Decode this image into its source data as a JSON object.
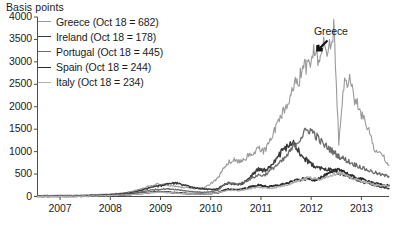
{
  "axis": {
    "ylabel": "Basis points",
    "yticks": [
      "4000",
      "3500",
      "3000",
      "2500",
      "2000",
      "1500",
      "1000",
      "500",
      "0"
    ],
    "xticks": [
      "2007",
      "2008",
      "2009",
      "2010",
      "2011",
      "2012",
      "2013"
    ]
  },
  "annotation": {
    "greece_label": "Greece"
  },
  "legend": [
    {
      "label": "Greece (Oct 18 = 682)",
      "color": "#9a9a9a",
      "width": 1.1
    },
    {
      "label": "Ireland (Oct 18 = 178)",
      "color": "#3a3a3a",
      "width": 1.5
    },
    {
      "label": "Portugal (Oct 18 = 445)",
      "color": "#6b6b6b",
      "width": 1.3
    },
    {
      "label": "Spain (Oct 18 = 244)",
      "color": "#2a2a2a",
      "width": 1.8
    },
    {
      "label": "Italy (Oct 18 = 234)",
      "color": "#b0b0b0",
      "width": 1.4
    }
  ],
  "chart_data": {
    "type": "line",
    "title": "",
    "xlabel": "",
    "ylabel": "Basis points",
    "ylim": [
      0,
      4000
    ],
    "xlim": [
      "2006-07",
      "2013-08"
    ],
    "grid": false,
    "legend_position": "top-left",
    "x_tick_values": [
      2007,
      2008,
      2009,
      2010,
      2011,
      2012,
      2013
    ],
    "x": [
      2006.55,
      2006.65,
      2006.75,
      2006.85,
      2006.95,
      2007.05,
      2007.15,
      2007.25,
      2007.35,
      2007.45,
      2007.55,
      2007.65,
      2007.75,
      2007.85,
      2007.95,
      2008.05,
      2008.15,
      2008.25,
      2008.35,
      2008.45,
      2008.55,
      2008.65,
      2008.75,
      2008.85,
      2008.95,
      2009.05,
      2009.15,
      2009.25,
      2009.35,
      2009.45,
      2009.55,
      2009.65,
      2009.75,
      2009.85,
      2009.95,
      2010.05,
      2010.15,
      2010.25,
      2010.35,
      2010.45,
      2010.55,
      2010.65,
      2010.75,
      2010.85,
      2010.95,
      2011.05,
      2011.15,
      2011.25,
      2011.35,
      2011.45,
      2011.55,
      2011.65,
      2011.75,
      2011.85,
      2011.95,
      2012.05,
      2012.15,
      2012.25,
      2012.35,
      2012.45,
      2012.55,
      2012.65,
      2012.75,
      2012.85,
      2012.95,
      2013.05,
      2013.15,
      2013.25,
      2013.35,
      2013.45,
      2013.55
    ],
    "series": [
      {
        "name": "Greece",
        "color": "#9a9a9a",
        "last_value": 682,
        "peak_value": 3750,
        "values": [
          22,
          24,
          26,
          25,
          27,
          28,
          30,
          29,
          31,
          34,
          38,
          42,
          45,
          48,
          55,
          62,
          70,
          78,
          95,
          120,
          150,
          185,
          230,
          260,
          280,
          270,
          250,
          230,
          215,
          200,
          190,
          180,
          175,
          190,
          250,
          320,
          420,
          620,
          760,
          820,
          790,
          830,
          900,
          980,
          1060,
          1000,
          1150,
          1480,
          1620,
          1880,
          2150,
          2450,
          2620,
          2820,
          2980,
          3180,
          3000,
          3450,
          3250,
          3750,
          1200,
          2420,
          2700,
          2250,
          1960,
          1720,
          1450,
          1080,
          980,
          880,
          700
        ]
      },
      {
        "name": "Ireland",
        "color": "#3a3a3a",
        "last_value": 178,
        "peak_value": 1180,
        "values": [
          4,
          5,
          5,
          6,
          6,
          7,
          8,
          9,
          11,
          14,
          18,
          22,
          26,
          30,
          36,
          44,
          52,
          62,
          78,
          96,
          120,
          150,
          180,
          210,
          230,
          250,
          280,
          300,
          290,
          260,
          230,
          200,
          180,
          170,
          160,
          155,
          175,
          260,
          300,
          280,
          265,
          300,
          380,
          520,
          600,
          580,
          640,
          780,
          900,
          1050,
          1120,
          1180,
          1020,
          880,
          760,
          700,
          650,
          620,
          600,
          560,
          520,
          480,
          440,
          400,
          360,
          320,
          290,
          260,
          230,
          200,
          180
        ]
      },
      {
        "name": "Portugal",
        "color": "#6b6b6b",
        "last_value": 445,
        "peak_value": 1500,
        "values": [
          3,
          4,
          4,
          5,
          5,
          6,
          7,
          8,
          9,
          12,
          15,
          18,
          21,
          24,
          28,
          34,
          40,
          48,
          58,
          72,
          88,
          110,
          130,
          150,
          160,
          165,
          170,
          165,
          150,
          135,
          120,
          108,
          100,
          95,
          98,
          110,
          140,
          250,
          300,
          290,
          275,
          310,
          370,
          430,
          480,
          470,
          540,
          650,
          720,
          820,
          950,
          1120,
          1250,
          1400,
          1500,
          1420,
          1280,
          1150,
          1080,
          980,
          900,
          840,
          780,
          720,
          680,
          620,
          580,
          540,
          500,
          470,
          450
        ]
      },
      {
        "name": "Spain",
        "color": "#2a2a2a",
        "last_value": 244,
        "peak_value": 620,
        "values": [
          2,
          2,
          3,
          3,
          3,
          4,
          4,
          5,
          6,
          8,
          10,
          12,
          14,
          16,
          19,
          23,
          27,
          32,
          40,
          50,
          62,
          75,
          88,
          98,
          105,
          100,
          95,
          88,
          80,
          72,
          66,
          60,
          58,
          58,
          62,
          72,
          88,
          130,
          160,
          155,
          150,
          170,
          200,
          230,
          250,
          240,
          215,
          230,
          250,
          275,
          300,
          340,
          370,
          390,
          400,
          370,
          400,
          450,
          500,
          560,
          620,
          560,
          480,
          430,
          400,
          370,
          340,
          300,
          270,
          250,
          245
        ]
      },
      {
        "name": "Italy",
        "color": "#b0b0b0",
        "last_value": 234,
        "peak_value": 540,
        "values": [
          2,
          2,
          3,
          3,
          3,
          4,
          4,
          5,
          6,
          7,
          9,
          11,
          13,
          15,
          18,
          22,
          26,
          31,
          38,
          46,
          56,
          68,
          80,
          90,
          96,
          92,
          88,
          82,
          75,
          68,
          62,
          58,
          55,
          56,
          60,
          70,
          85,
          118,
          140,
          135,
          130,
          148,
          170,
          190,
          205,
          198,
          180,
          195,
          215,
          240,
          270,
          320,
          360,
          390,
          420,
          400,
          380,
          420,
          460,
          500,
          540,
          490,
          430,
          390,
          360,
          330,
          300,
          270,
          250,
          238,
          234
        ]
      }
    ]
  }
}
